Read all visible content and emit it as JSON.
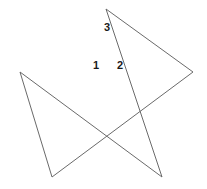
{
  "figure": {
    "name": "pentagram-star-with-angle-labels",
    "width": 207,
    "height": 189,
    "background_color": "#ffffff",
    "stroke_color": "#6a6a6a",
    "stroke_width": 1,
    "label_color": "#1a1a1a",
    "vertices": [
      {
        "name": "apex",
        "x": 106,
        "y": 9
      },
      {
        "name": "right-point",
        "x": 193,
        "y": 72
      },
      {
        "name": "bottom-left-point",
        "x": 52,
        "y": 177
      },
      {
        "name": "left-point",
        "x": 20,
        "y": 72
      },
      {
        "name": "bottom-right-point",
        "x": 162,
        "y": 177
      }
    ],
    "path": "M 106 9 L 193 72 L 52 177 L 20 72 L 162 177 Z",
    "labels": [
      {
        "id": "label-1",
        "text": "1",
        "x": 96,
        "y": 65
      },
      {
        "id": "label-2",
        "text": "2",
        "x": 120,
        "y": 65
      },
      {
        "id": "label-3",
        "text": "3",
        "x": 107,
        "y": 27
      }
    ]
  }
}
